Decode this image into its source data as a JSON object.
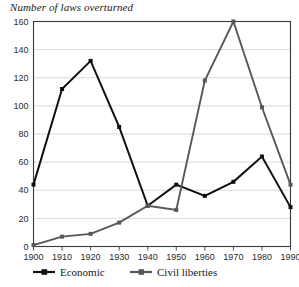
{
  "chart_data": {
    "type": "line",
    "title": "Number of laws overturned",
    "xlabel": "",
    "ylabel": "",
    "x": [
      1900,
      1910,
      1920,
      1930,
      1940,
      1950,
      1960,
      1970,
      1980,
      1990
    ],
    "categories": [
      "1900",
      "1910",
      "1920",
      "1930",
      "1940",
      "1950",
      "1960",
      "1970",
      "1980",
      "1990"
    ],
    "series": [
      {
        "name": "Economic",
        "color": "#101010",
        "marker": "square",
        "values": [
          44,
          112,
          132,
          85,
          29,
          44,
          36,
          46,
          64,
          28
        ]
      },
      {
        "name": "Civil liberties",
        "color": "#575757",
        "marker": "square",
        "values": [
          1,
          7,
          9,
          17,
          29,
          26,
          118,
          160,
          99,
          44
        ]
      }
    ],
    "xlim": [
      1900,
      1990
    ],
    "ylim": [
      0,
      160
    ],
    "yticks": [
      0,
      20,
      40,
      60,
      80,
      100,
      120,
      140,
      160
    ],
    "ytick_labels": [
      "0",
      "20",
      "40",
      "60",
      "80",
      "100",
      "120",
      "140",
      "160"
    ],
    "xticks": [
      1900,
      1910,
      1920,
      1930,
      1940,
      1950,
      1960,
      1970,
      1980,
      1990
    ],
    "xtick_labels": [
      "1900",
      "1910",
      "1920",
      "1930",
      "1940",
      "1950",
      "1960",
      "1970",
      "1980",
      "1990"
    ],
    "grid": true,
    "grid_color": "#c9c9c9",
    "axis_color": "#3a3a3a",
    "legend_position": "bottom",
    "legend": [
      "Economic",
      "Civil liberties"
    ]
  },
  "legend": {
    "items": [
      {
        "label": "Economic",
        "color": "#101010"
      },
      {
        "label": "Civil liberties",
        "color": "#575757"
      }
    ]
  }
}
